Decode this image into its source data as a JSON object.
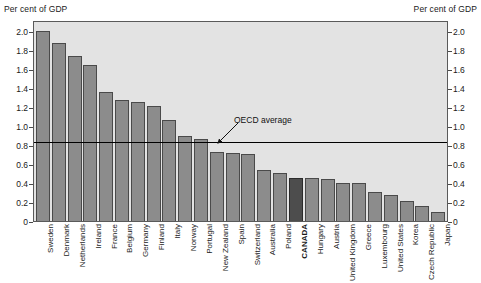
{
  "axis_captions": {
    "left": "Per cent of GDP",
    "right": "Per cent of GDP"
  },
  "annotations": {
    "oecd_average_label": "OECD average"
  },
  "colors": {
    "bar": "#8c8c8c",
    "bar_highlight": "#4d4d4d",
    "bar_border": "#4a4a4a",
    "plot_background": "#e3e3e3",
    "average_line": "#000000",
    "text": "#1a1a1a"
  },
  "chart_data": {
    "type": "bar",
    "title": "",
    "subtitle": "",
    "xlabel": "",
    "ylabel": "Per cent of GDP",
    "ylim": [
      0,
      2.12
    ],
    "yticks": [
      0,
      0.2,
      0.4,
      0.6,
      0.8,
      1.0,
      1.2,
      1.4,
      1.6,
      1.8,
      2.0
    ],
    "ytick_labels": [
      "0",
      "0.2",
      "0.4",
      "0.6",
      "0.8",
      "1.0",
      "1.2",
      "1.4",
      "1.6",
      "1.8",
      "2.0"
    ],
    "grid": false,
    "legend": null,
    "dual_axis": true,
    "highlight_category": "CANADA",
    "reference_line": {
      "label": "OECD average",
      "value": 0.83,
      "orientation": "horizontal"
    },
    "categories": [
      "Sweden",
      "Denmark",
      "Netherlands",
      "Ireland",
      "France",
      "Belgium",
      "Germany",
      "Finland",
      "Italy",
      "Norway",
      "Portugal",
      "New Zealand",
      "Spain",
      "Switzerland",
      "Australia",
      "Poland",
      "CANADA",
      "Hungary",
      "Austria",
      "United Kingdom",
      "Greece",
      "Luxembourg",
      "United States",
      "Korea",
      "Czech Republic",
      "Japan"
    ],
    "values": [
      2.02,
      1.9,
      1.76,
      1.66,
      1.37,
      1.29,
      1.27,
      1.23,
      1.08,
      0.91,
      0.87,
      0.73,
      0.72,
      0.71,
      0.54,
      0.51,
      0.46,
      0.46,
      0.45,
      0.41,
      0.4,
      0.31,
      0.28,
      0.21,
      0.16,
      0.1
    ]
  }
}
